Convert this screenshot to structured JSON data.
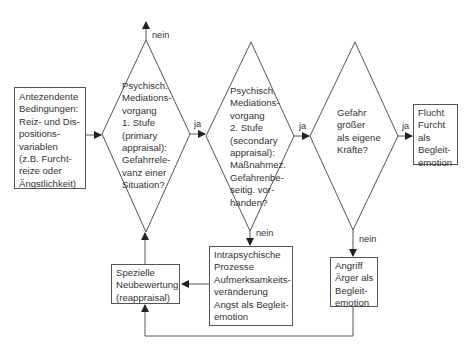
{
  "diagram": {
    "nodes": {
      "antecedent": {
        "type": "box",
        "lines": [
          "Antezendente",
          "Bedingungen:",
          "Reiz- und Dis-",
          "positions-",
          "variablen",
          "(z.B. Furcht-",
          "reize oder",
          "Ängstlichkeit)"
        ]
      },
      "stage1": {
        "type": "decision",
        "lines": [
          "Psychisch.",
          "Mediations-",
          "vorgang",
          "1. Stufe",
          "(primary",
          "appraisal):",
          "Gefahrrele-",
          "vanz einer",
          "Situation?"
        ]
      },
      "stage2": {
        "type": "decision",
        "lines": [
          "Psychisch.",
          "Mediations-",
          "vorgang",
          "2. Stufe",
          "(secondary",
          "appraisal):",
          "Maßnahmez.",
          "Gefahrenbe-",
          "seitig. vor-",
          "handen?"
        ]
      },
      "danger": {
        "type": "decision",
        "lines": [
          "Gefahr",
          "größer",
          "als eigene",
          "Kräfte?"
        ]
      },
      "flight": {
        "type": "box",
        "lines": [
          "Flucht",
          "Furcht",
          "als",
          "Begleit-",
          "emotion"
        ]
      },
      "intrapsychic": {
        "type": "box",
        "lines": [
          "Intrapsychische",
          "Prozesse",
          "Aufmerksamkeits-",
          "veränderung",
          "Angst als Begleit-",
          "emotion"
        ]
      },
      "attack": {
        "type": "box",
        "lines": [
          "Angriff",
          "Ärger als",
          "Begleit-",
          "emotion"
        ]
      },
      "reappraisal": {
        "type": "box",
        "lines": [
          "Spezielle",
          "Neubewertung",
          "(reappraisal)"
        ]
      }
    },
    "edge_labels": {
      "stage1_no": "nein",
      "stage1_yes": "ja",
      "stage2_yes": "ja",
      "stage2_no": "nein",
      "danger_yes": "ja",
      "danger_no": "nein"
    },
    "colors": {
      "line": "#444444",
      "text": "#333333",
      "background": "#ffffff"
    }
  }
}
